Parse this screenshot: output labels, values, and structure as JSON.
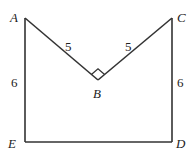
{
  "diagram": {
    "points": {
      "A": {
        "label": "A",
        "x": 25,
        "y": 18
      },
      "B": {
        "label": "B",
        "x": 98,
        "y": 80
      },
      "C": {
        "label": "C",
        "x": 172,
        "y": 18
      },
      "D": {
        "label": "D",
        "x": 172,
        "y": 142
      },
      "E": {
        "label": "E",
        "x": 25,
        "y": 142
      }
    },
    "edges": [
      {
        "from": "A",
        "to": "B",
        "length_label": "5"
      },
      {
        "from": "B",
        "to": "C",
        "length_label": "5"
      },
      {
        "from": "C",
        "to": "D",
        "length_label": "6"
      },
      {
        "from": "D",
        "to": "E",
        "length_label": ""
      },
      {
        "from": "E",
        "to": "A",
        "length_label": "6"
      }
    ],
    "right_angle_at": "B"
  }
}
